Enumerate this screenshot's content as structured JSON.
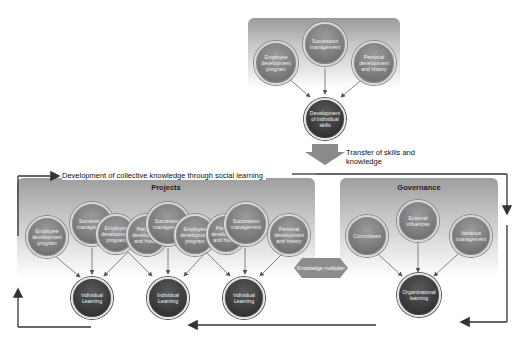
{
  "top_group": {
    "inputs": [
      {
        "label": "Employee development program"
      },
      {
        "label": "Succession management"
      },
      {
        "label": "Personal development and history"
      }
    ],
    "output": {
      "label": "Development of individual skills"
    }
  },
  "transfer_label": "Transfer of skills and knowledge",
  "collective_label": "Development of collective knowledge through social learning",
  "projects": {
    "title": "Projects",
    "inputs": [
      {
        "label": "Employee development program"
      },
      {
        "label": "Succession management"
      },
      {
        "label": "Employee development program"
      },
      {
        "label": "Personal development and history"
      },
      {
        "label": "Succession management"
      },
      {
        "label": "Employee development program"
      },
      {
        "label": "Personal development and history"
      },
      {
        "label": "Succession management"
      },
      {
        "label": "Personal development and history"
      }
    ],
    "outputs": [
      {
        "label": "Individual Learning"
      },
      {
        "label": "Individual Learning"
      },
      {
        "label": "Individual Learning"
      }
    ]
  },
  "knowledge_multiplier": {
    "label": "Knowledge multiplier"
  },
  "governance": {
    "title": "Governance",
    "inputs": [
      {
        "label": "Committees"
      },
      {
        "label": "External influences"
      },
      {
        "label": "Variance management"
      }
    ],
    "output": {
      "label": "Organizational learning"
    }
  },
  "colors": {
    "panel_dark": "#9a9a9a",
    "node_mid": "#7a7a7a",
    "node_dark": "#2e2e2e",
    "arrow": "#333333",
    "flow_line": "#3a3a3a"
  }
}
